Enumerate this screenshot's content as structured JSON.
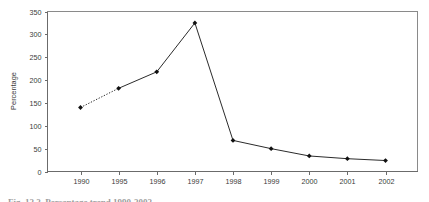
{
  "figure": {
    "caption": "Fig. 12.2.  Percentage trend 1990-2002"
  },
  "chart_data": {
    "type": "line",
    "title": "",
    "xlabel": "",
    "ylabel": "Percentage",
    "categories": [
      "1990",
      "1995",
      "1996",
      "1997",
      "1998",
      "1999",
      "2000",
      "2001",
      "2002"
    ],
    "values": [
      140,
      182,
      218,
      325,
      68,
      50,
      34,
      28,
      24
    ],
    "series": [
      {
        "name": "Percentage",
        "values": [
          140,
          182,
          218,
          325,
          68,
          50,
          34,
          28,
          24
        ]
      }
    ],
    "ylim": [
      0,
      350
    ],
    "yticks": [
      0,
      50,
      100,
      150,
      200,
      250,
      300,
      350
    ],
    "ytick_labels": [
      "0",
      "50",
      "100",
      "150",
      "200",
      "250",
      "300",
      "350"
    ],
    "xtick_labels": [
      "1990",
      "1995",
      "1996",
      "1997",
      "1998",
      "1999",
      "2000",
      "2001",
      "2002"
    ],
    "grid": false,
    "legend": false,
    "legend_position": "none",
    "marker": "filled-diamond",
    "line_color": "#2b2b2b",
    "marker_color": "#111111",
    "dashed_segments": [
      [
        0,
        1
      ]
    ],
    "annotations": []
  }
}
